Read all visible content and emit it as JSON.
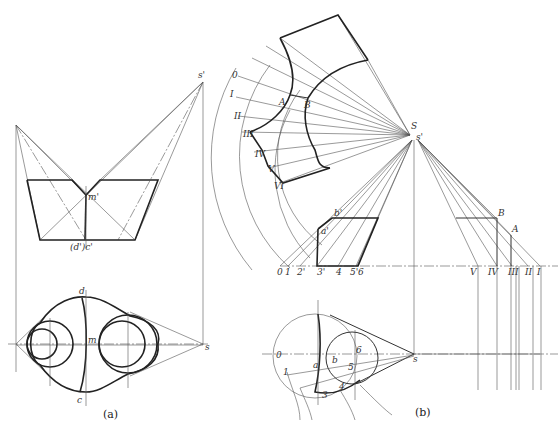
{
  "figure_a": {
    "caption": "(a)",
    "labels": {
      "s_prime": "s'",
      "m_prime": "m'",
      "dc_prime": "(d')c'",
      "d": "d",
      "m": "m",
      "c": "c",
      "s": "s"
    }
  },
  "figure_b": {
    "caption": "(b)",
    "labels": {
      "roman": [
        "0",
        "I",
        "II",
        "III",
        "IV",
        "V",
        "VI"
      ],
      "A": "A",
      "B": "B",
      "S": "S",
      "s_prime": "s'",
      "a_prime": "a'",
      "b_prime": "b'",
      "ground_left": [
        "0",
        "1",
        "2'",
        "3'",
        "4",
        "5'",
        "6"
      ],
      "ground_right": [
        "V",
        "IV",
        "III",
        "II",
        "I"
      ],
      "A2": "A",
      "B2": "B",
      "plan": {
        "o": "0",
        "one": "1",
        "a": "a",
        "b": "b",
        "five": "5",
        "six": "6",
        "s": "s",
        "three": "3",
        "four": "4"
      }
    }
  }
}
